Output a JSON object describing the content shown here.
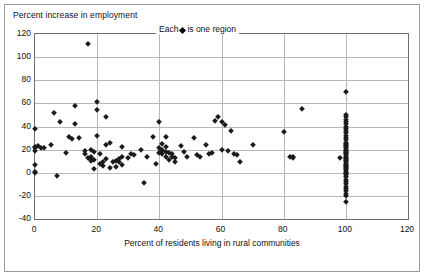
{
  "chart_data": {
    "type": "scatter",
    "title": "",
    "ylabel": "Percent increase in employment",
    "xlabel": "Percent of residents living in rural communities",
    "legend": {
      "text_before": "Each",
      "marker": "diamond-marker",
      "text_after": "is one region",
      "position": "inside-top-center"
    },
    "xlim": [
      0,
      120
    ],
    "ylim": [
      -40,
      120
    ],
    "xticks": [
      0,
      20,
      40,
      60,
      80,
      100,
      120
    ],
    "yticks": [
      -40,
      -20,
      0,
      20,
      40,
      60,
      80,
      100,
      120
    ],
    "grid": "horizontal-and-vertical",
    "marker_color": "#1a1a1a",
    "series": [
      {
        "name": "regions",
        "points": [
          [
            0,
            38
          ],
          [
            0,
            22
          ],
          [
            0,
            21
          ],
          [
            0,
            19
          ],
          [
            0,
            7
          ],
          [
            0,
            1
          ],
          [
            0,
            0
          ],
          [
            1,
            23
          ],
          [
            2,
            21
          ],
          [
            3,
            21
          ],
          [
            5,
            24
          ],
          [
            6,
            52
          ],
          [
            7,
            -3
          ],
          [
            8,
            44
          ],
          [
            10,
            17
          ],
          [
            11,
            31
          ],
          [
            12,
            29
          ],
          [
            13,
            58
          ],
          [
            13,
            42
          ],
          [
            14,
            30
          ],
          [
            16,
            19
          ],
          [
            16,
            16
          ],
          [
            17,
            13
          ],
          [
            17,
            111
          ],
          [
            18,
            20
          ],
          [
            18,
            14
          ],
          [
            18,
            12
          ],
          [
            18,
            10
          ],
          [
            19,
            18
          ],
          [
            19,
            11
          ],
          [
            19,
            3
          ],
          [
            20,
            61
          ],
          [
            20,
            54
          ],
          [
            20,
            32
          ],
          [
            21,
            16
          ],
          [
            21,
            8
          ],
          [
            22,
            9
          ],
          [
            22,
            6
          ],
          [
            23,
            48
          ],
          [
            23,
            12
          ],
          [
            23,
            24
          ],
          [
            24,
            26
          ],
          [
            24,
            4
          ],
          [
            25,
            9
          ],
          [
            26,
            10
          ],
          [
            26,
            5
          ],
          [
            27,
            12
          ],
          [
            27,
            9
          ],
          [
            28,
            14
          ],
          [
            28,
            7
          ],
          [
            28,
            22
          ],
          [
            30,
            13
          ],
          [
            31,
            16
          ],
          [
            32,
            15
          ],
          [
            34,
            20
          ],
          [
            35,
            -9
          ],
          [
            36,
            14
          ],
          [
            38,
            31
          ],
          [
            39,
            8
          ],
          [
            40,
            44
          ],
          [
            40,
            21
          ],
          [
            40,
            17
          ],
          [
            41,
            25
          ],
          [
            41,
            20
          ],
          [
            41,
            19
          ],
          [
            41,
            16
          ],
          [
            42,
            31
          ],
          [
            42,
            22
          ],
          [
            42,
            18
          ],
          [
            42,
            14
          ],
          [
            43,
            17
          ],
          [
            43,
            11
          ],
          [
            44,
            14
          ],
          [
            44,
            16
          ],
          [
            45,
            9
          ],
          [
            45,
            13
          ],
          [
            47,
            23
          ],
          [
            48,
            18
          ],
          [
            49,
            14
          ],
          [
            51,
            30
          ],
          [
            52,
            15
          ],
          [
            53,
            14
          ],
          [
            55,
            24
          ],
          [
            56,
            16
          ],
          [
            57,
            17
          ],
          [
            58,
            45
          ],
          [
            59,
            48
          ],
          [
            60,
            44
          ],
          [
            60,
            20
          ],
          [
            61,
            41
          ],
          [
            62,
            19
          ],
          [
            63,
            36
          ],
          [
            64,
            16
          ],
          [
            65,
            15
          ],
          [
            66,
            9
          ],
          [
            70,
            24
          ],
          [
            80,
            35
          ],
          [
            82,
            14
          ],
          [
            83,
            14
          ],
          [
            83,
            13
          ],
          [
            86,
            55
          ],
          [
            100,
            70
          ],
          [
            100,
            50
          ],
          [
            100,
            48
          ],
          [
            100,
            46
          ],
          [
            100,
            44
          ],
          [
            100,
            42
          ],
          [
            100,
            40
          ],
          [
            100,
            38
          ],
          [
            100,
            36
          ],
          [
            100,
            34
          ],
          [
            100,
            32
          ],
          [
            100,
            30
          ],
          [
            100,
            28
          ],
          [
            100,
            26
          ],
          [
            100,
            25
          ],
          [
            100,
            24
          ],
          [
            100,
            23
          ],
          [
            100,
            22
          ],
          [
            100,
            21
          ],
          [
            100,
            20
          ],
          [
            100,
            19
          ],
          [
            100,
            18
          ],
          [
            100,
            17
          ],
          [
            100,
            16
          ],
          [
            100,
            15
          ],
          [
            100,
            14
          ],
          [
            100,
            13
          ],
          [
            100,
            12
          ],
          [
            100,
            11
          ],
          [
            100,
            10
          ],
          [
            100,
            9
          ],
          [
            100,
            8
          ],
          [
            100,
            7
          ],
          [
            100,
            6
          ],
          [
            100,
            5
          ],
          [
            100,
            4
          ],
          [
            100,
            3
          ],
          [
            100,
            2
          ],
          [
            100,
            1
          ],
          [
            100,
            0
          ],
          [
            100,
            -1
          ],
          [
            100,
            -2
          ],
          [
            100,
            -4
          ],
          [
            100,
            -6
          ],
          [
            100,
            -8
          ],
          [
            100,
            -10
          ],
          [
            100,
            -12
          ],
          [
            100,
            -14
          ],
          [
            100,
            -16
          ],
          [
            100,
            -18
          ],
          [
            100,
            -20
          ],
          [
            100,
            -25
          ],
          [
            98,
            13
          ]
        ]
      }
    ]
  }
}
